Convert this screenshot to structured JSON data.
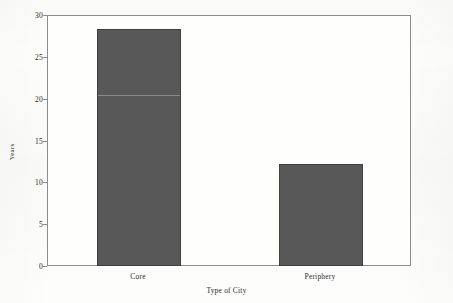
{
  "chart_data": {
    "type": "bar",
    "title": "",
    "subtitle": "",
    "categories": [
      "Core",
      "Periphery"
    ],
    "values": [
      28.5,
      12.3
    ],
    "xlabel": "Type of City",
    "ylabel": "Years",
    "ylim": [
      0,
      30
    ],
    "yticks": [
      0,
      5,
      10,
      15,
      20,
      25,
      30
    ],
    "ytick_labels": [
      "0",
      "5",
      "10",
      "15",
      "20",
      "25",
      "30"
    ],
    "grid": false,
    "legend": false,
    "legend_position": "none",
    "bar_color": "#585858",
    "bar_edge_color": "#3f3f3f",
    "frame_color": "#8c8c8c",
    "background_color": "#fdfdfb",
    "text_color": "#2b2b2b",
    "annotations": []
  }
}
